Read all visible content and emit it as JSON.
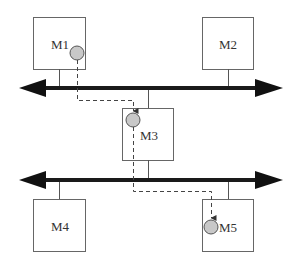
{
  "diagram": {
    "type": "network-bus-migration",
    "colors": {
      "bus": "#1a1a1a",
      "box_stroke": "#666666",
      "agent_fill": "#c8c8c8",
      "agent_stroke": "#555555",
      "path": "#444444"
    },
    "buses": [
      {
        "id": "bus-top",
        "y": 88,
        "direction": "bidirectional"
      },
      {
        "id": "bus-bottom",
        "y": 180,
        "direction": "bidirectional"
      }
    ],
    "nodes": [
      {
        "id": "M1",
        "label": "M1",
        "bus": "bus-top",
        "has_agent": true
      },
      {
        "id": "M2",
        "label": "M2",
        "bus": "bus-top",
        "has_agent": false
      },
      {
        "id": "M3",
        "label": "M3",
        "bus": "both",
        "has_agent": true
      },
      {
        "id": "M4",
        "label": "M4",
        "bus": "bus-bottom",
        "has_agent": false
      },
      {
        "id": "M5",
        "label": "M5",
        "bus": "bus-bottom",
        "has_agent": true
      }
    ],
    "migration_path": [
      "M1",
      "M3",
      "M5"
    ]
  }
}
